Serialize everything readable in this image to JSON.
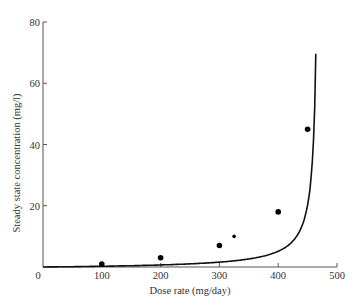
{
  "chart_data": {
    "type": "line",
    "title": "",
    "xlabel": "Dose rate (mg/day)",
    "ylabel": "Steady state concentration (mg/l)",
    "xlim": [
      0,
      500
    ],
    "ylim": [
      0,
      80
    ],
    "x_ticks": [
      0,
      100,
      200,
      300,
      400,
      500
    ],
    "y_ticks": [
      20,
      40,
      60,
      80
    ],
    "grid": false,
    "legend": null,
    "series": [
      {
        "name": "Observed",
        "kind": "scatter",
        "x": [
          100,
          200,
          300,
          325,
          400,
          450
        ],
        "y": [
          1,
          3,
          7,
          10,
          18,
          45
        ]
      },
      {
        "name": "Fitted curve",
        "kind": "line",
        "model": "Michaelis-Menten: C = Km*R/(Vmax-R)",
        "x": [
          0,
          50,
          100,
          150,
          200,
          250,
          300,
          350,
          400,
          425,
          450,
          460,
          465
        ],
        "y": [
          0,
          0.4,
          1,
          1.8,
          3,
          4.6,
          7,
          10.8,
          18,
          26,
          45,
          63,
          78
        ]
      }
    ]
  },
  "labels": {
    "xlabel": "Dose rate (mg/day)",
    "ylabel": "Steady state concentration (mg/l)",
    "x_tick_labels": [
      "0",
      "100",
      "200",
      "300",
      "400",
      "500"
    ],
    "y_tick_labels": [
      "20",
      "40",
      "60",
      "80"
    ]
  }
}
